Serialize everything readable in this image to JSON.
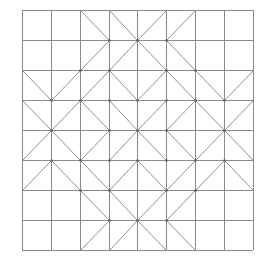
{
  "diagram": {
    "title": "",
    "grid": {
      "cols": 8,
      "rows": 8,
      "x_lines": [
        22,
        51,
        80,
        109,
        137,
        166,
        195,
        224,
        253
      ],
      "y_lines": [
        10,
        40,
        70,
        100,
        130,
        160,
        190,
        220,
        250
      ]
    },
    "colors": {
      "background": "#ffffff",
      "grid_line": "#8a8a8a",
      "diagonal_line": "#8f8f8f",
      "vertex_dot": "#666666"
    },
    "diagonals": [
      {
        "row": 0,
        "col": 2,
        "dir": "\\"
      },
      {
        "row": 0,
        "col": 3,
        "dir": "\\"
      },
      {
        "row": 0,
        "col": 4,
        "dir": "/"
      },
      {
        "row": 0,
        "col": 5,
        "dir": "/"
      },
      {
        "row": 1,
        "col": 2,
        "dir": "/"
      },
      {
        "row": 1,
        "col": 3,
        "dir": "/"
      },
      {
        "row": 1,
        "col": 4,
        "dir": "\\"
      },
      {
        "row": 1,
        "col": 5,
        "dir": "\\"
      },
      {
        "row": 2,
        "col": 0,
        "dir": "\\"
      },
      {
        "row": 2,
        "col": 1,
        "dir": "/"
      },
      {
        "row": 2,
        "col": 2,
        "dir": "/"
      },
      {
        "row": 2,
        "col": 3,
        "dir": "\\"
      },
      {
        "row": 2,
        "col": 4,
        "dir": "/"
      },
      {
        "row": 2,
        "col": 5,
        "dir": "\\"
      },
      {
        "row": 2,
        "col": 6,
        "dir": "\\"
      },
      {
        "row": 2,
        "col": 7,
        "dir": "/"
      },
      {
        "row": 3,
        "col": 0,
        "dir": "\\"
      },
      {
        "row": 3,
        "col": 1,
        "dir": "/"
      },
      {
        "row": 3,
        "col": 2,
        "dir": "\\"
      },
      {
        "row": 3,
        "col": 3,
        "dir": "\\"
      },
      {
        "row": 3,
        "col": 4,
        "dir": "/"
      },
      {
        "row": 3,
        "col": 5,
        "dir": "/"
      },
      {
        "row": 3,
        "col": 6,
        "dir": "\\"
      },
      {
        "row": 3,
        "col": 7,
        "dir": "/"
      },
      {
        "row": 4,
        "col": 0,
        "dir": "/"
      },
      {
        "row": 4,
        "col": 1,
        "dir": "\\"
      },
      {
        "row": 4,
        "col": 2,
        "dir": "/"
      },
      {
        "row": 4,
        "col": 3,
        "dir": "/"
      },
      {
        "row": 4,
        "col": 4,
        "dir": "\\"
      },
      {
        "row": 4,
        "col": 5,
        "dir": "\\"
      },
      {
        "row": 4,
        "col": 6,
        "dir": "/"
      },
      {
        "row": 4,
        "col": 7,
        "dir": "\\"
      },
      {
        "row": 5,
        "col": 0,
        "dir": "/"
      },
      {
        "row": 5,
        "col": 1,
        "dir": "\\"
      },
      {
        "row": 5,
        "col": 2,
        "dir": "\\"
      },
      {
        "row": 5,
        "col": 3,
        "dir": "/"
      },
      {
        "row": 5,
        "col": 4,
        "dir": "\\"
      },
      {
        "row": 5,
        "col": 5,
        "dir": "/"
      },
      {
        "row": 5,
        "col": 6,
        "dir": "/"
      },
      {
        "row": 5,
        "col": 7,
        "dir": "\\"
      },
      {
        "row": 6,
        "col": 2,
        "dir": "\\"
      },
      {
        "row": 6,
        "col": 3,
        "dir": "\\"
      },
      {
        "row": 6,
        "col": 4,
        "dir": "/"
      },
      {
        "row": 6,
        "col": 5,
        "dir": "/"
      },
      {
        "row": 7,
        "col": 2,
        "dir": "/"
      },
      {
        "row": 7,
        "col": 3,
        "dir": "/"
      },
      {
        "row": 7,
        "col": 4,
        "dir": "\\"
      },
      {
        "row": 7,
        "col": 5,
        "dir": "\\"
      }
    ]
  }
}
